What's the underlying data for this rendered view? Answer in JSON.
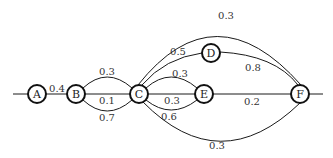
{
  "diagram": {
    "type": "weighted-graph",
    "nodes": [
      {
        "id": "A",
        "label": "A"
      },
      {
        "id": "B",
        "label": "B"
      },
      {
        "id": "C",
        "label": "C"
      },
      {
        "id": "D",
        "label": "D"
      },
      {
        "id": "E",
        "label": "E"
      },
      {
        "id": "F",
        "label": "F"
      }
    ],
    "edges": [
      {
        "id": "in-A",
        "from": null,
        "to": "A",
        "weight": ""
      },
      {
        "id": "A-B",
        "from": "A",
        "to": "B",
        "weight": "0.4"
      },
      {
        "id": "B-C-top",
        "from": "B",
        "to": "C",
        "weight": "0.3"
      },
      {
        "id": "B-C-mid",
        "from": "B",
        "to": "C",
        "weight": "0.1"
      },
      {
        "id": "B-C-bot",
        "from": "B",
        "to": "C",
        "weight": "0.7"
      },
      {
        "id": "C-D",
        "from": "C",
        "to": "D",
        "weight": "0.5"
      },
      {
        "id": "D-F",
        "from": "D",
        "to": "F",
        "weight": "0.8"
      },
      {
        "id": "C-F-top",
        "from": "C",
        "to": "F",
        "weight": "0.3"
      },
      {
        "id": "C-E-top",
        "from": "C",
        "to": "E",
        "weight": "0.3"
      },
      {
        "id": "C-E-mid",
        "from": "C",
        "to": "E",
        "weight": "0.3"
      },
      {
        "id": "C-E-bot",
        "from": "C",
        "to": "E",
        "weight": "0.6"
      },
      {
        "id": "E-F",
        "from": "E",
        "to": "F",
        "weight": "0.2"
      },
      {
        "id": "C-F-bot",
        "from": "C",
        "to": "F",
        "weight": "0.3"
      },
      {
        "id": "out-F",
        "from": "F",
        "to": null,
        "weight": ""
      }
    ]
  }
}
